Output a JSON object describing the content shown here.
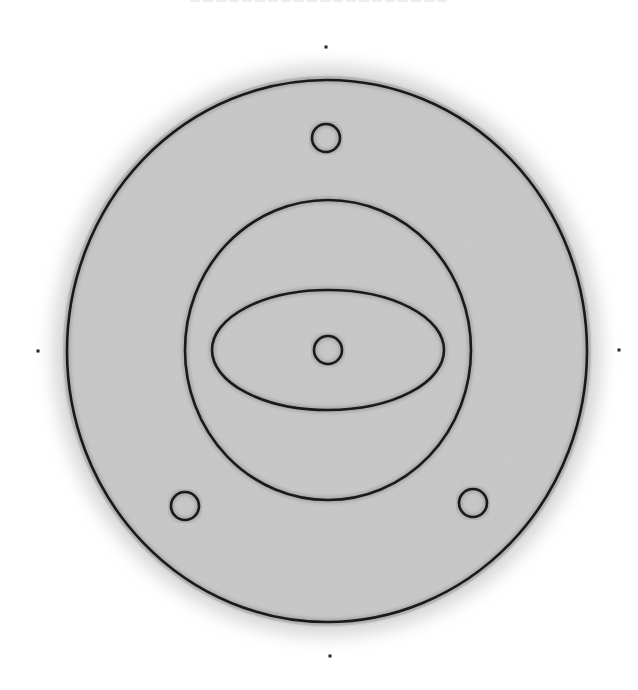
{
  "figure": {
    "title_visible": false,
    "canvas": {
      "width": 638,
      "height": 690
    },
    "colors": {
      "stroke": "#1a1a1a",
      "fill": "#c9c9c9",
      "halo": "#d6d6d6",
      "background": "#ffffff"
    },
    "outer_circle": {
      "cx": 327,
      "cy": 351,
      "rx": 260,
      "ry": 271
    },
    "middle_circle": {
      "cx": 328,
      "cy": 350,
      "rx": 143,
      "ry": 150
    },
    "inner_ellipse": {
      "cx": 328,
      "cy": 350,
      "rx": 116,
      "ry": 60
    },
    "center_node": {
      "cx": 328,
      "cy": 350,
      "r": 14
    },
    "satellite_nodes": [
      {
        "name": "top",
        "cx": 326,
        "cy": 138,
        "r": 14
      },
      {
        "name": "bottom-left",
        "cx": 185,
        "cy": 506,
        "r": 14
      },
      {
        "name": "bottom-right",
        "cx": 473,
        "cy": 503,
        "r": 14
      }
    ],
    "marker_dots": [
      {
        "name": "top",
        "cx": 326,
        "cy": 47
      },
      {
        "name": "left",
        "cx": 38,
        "cy": 351
      },
      {
        "name": "right",
        "cx": 619,
        "cy": 350
      },
      {
        "name": "bottom",
        "cx": 330,
        "cy": 656
      }
    ]
  }
}
